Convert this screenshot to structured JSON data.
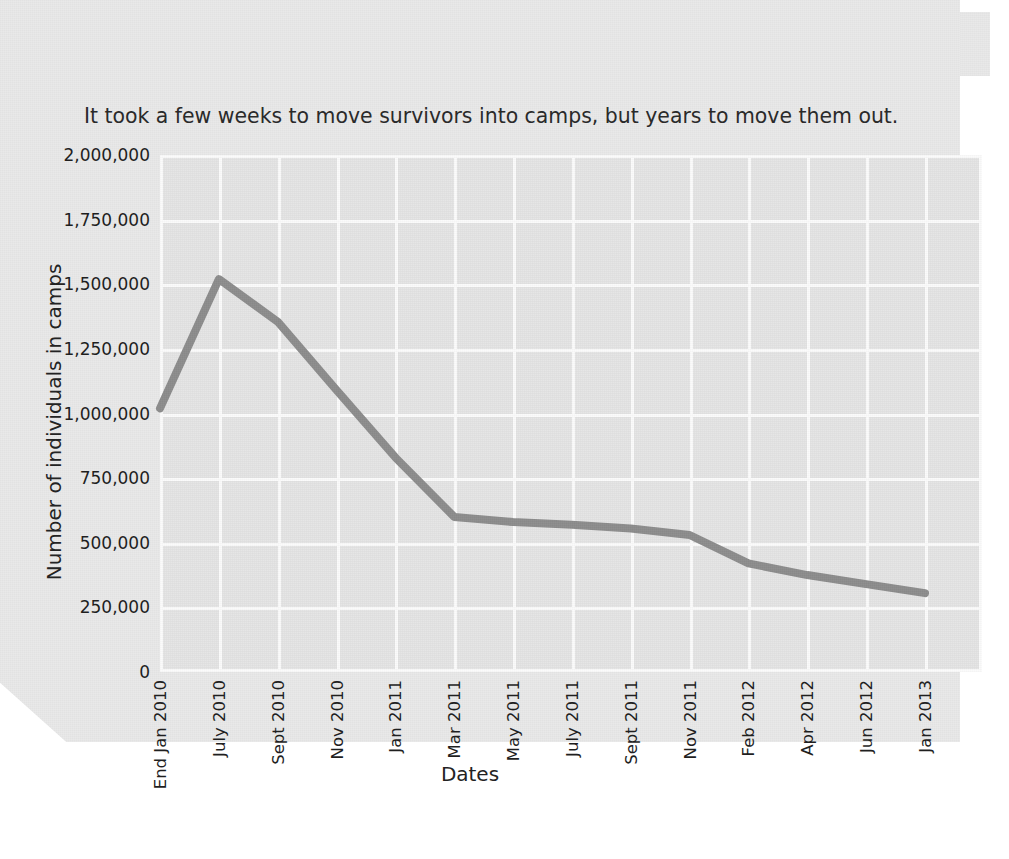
{
  "header": {
    "title": "TIMELINE: TENT CITIES",
    "subtitle": "It took a few weeks to move survivors into camps, but years to move them out."
  },
  "colors": {
    "page_background": "#ffffff",
    "paper": "#e9e9e9",
    "plot_background": "#e4e4e4",
    "gridline": "#fbfbfb",
    "series_line": "#8c8c8c",
    "text": "#1f1f1f",
    "title_text": "#171717"
  },
  "chart_data": {
    "type": "line",
    "title": "TIMELINE: TENT CITIES",
    "subtitle": "It took a few weeks to move survivors into camps, but years to move them out.",
    "xlabel": "Dates",
    "ylabel": "Number of individuals in camps",
    "ylim": [
      0,
      2000000
    ],
    "ytick_values": [
      0,
      250000,
      500000,
      750000,
      1000000,
      1250000,
      1500000,
      1750000,
      2000000
    ],
    "ytick_labels": [
      "0",
      "250,000",
      "500,000",
      "750,000",
      "1,000,000",
      "1,250,000",
      "1,500,000",
      "1,750,000",
      "2,000,000"
    ],
    "grid": true,
    "legend": "none",
    "categories": [
      "End Jan 2010",
      "July 2010",
      "Sept 2010",
      "Nov 2010",
      "Jan 2011",
      "Mar 2011",
      "May 2011",
      "July 2011",
      "Sept 2011",
      "Nov 2011",
      "Feb 2012",
      "Apr 2012",
      "Jun 2012",
      "Jan 2013"
    ],
    "values": [
      1020000,
      1520000,
      1355000,
      1090000,
      830000,
      600000,
      580000,
      570000,
      555000,
      530000,
      420000,
      375000,
      340000,
      305000
    ],
    "series": [
      {
        "name": "Number of individuals in camps",
        "values": [
          1020000,
          1520000,
          1355000,
          1090000,
          830000,
          600000,
          580000,
          570000,
          555000,
          530000,
          420000,
          375000,
          340000,
          305000
        ]
      }
    ]
  }
}
